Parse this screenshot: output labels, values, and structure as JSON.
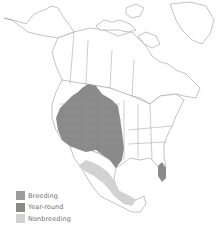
{
  "map": {
    "region": "North America",
    "colors": {
      "land": "#ffffff",
      "border": "#9a9a9a",
      "breeding": "#9b9b9b",
      "year_round": "#8a8a8a",
      "nonbreeding": "#d2d2d2"
    }
  },
  "legend": {
    "items": [
      {
        "label": "Breeding",
        "color": "#9b9b9b"
      },
      {
        "label": "Year-round",
        "color": "#8a8a8a"
      },
      {
        "label": "Nonbreeding",
        "color": "#d2d2d2"
      }
    ]
  }
}
